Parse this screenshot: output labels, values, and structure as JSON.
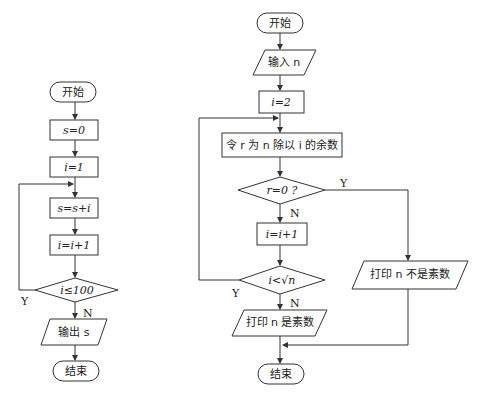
{
  "flowchart_left": {
    "start": "开始",
    "step1": "s=0",
    "step2": "i=1",
    "step3": "s=s+i",
    "step4": "i=i+1",
    "condition": "i≤100",
    "yes_label": "Y",
    "no_label": "N",
    "output": "输出 s",
    "end": "结束"
  },
  "flowchart_right": {
    "start": "开始",
    "input": "输入 n",
    "init": "i=2",
    "remainder": "令 r 为 n 除以 i 的余数",
    "cond1": "r=0 ?",
    "cond1_yes": "Y",
    "cond1_no": "N",
    "increment": "i=i+1",
    "cond2": "i<√n",
    "cond2_yes": "Y",
    "cond2_no": "N",
    "print_prime": "打印 n 是素数",
    "print_not_prime": "打印 n 不是素数",
    "end": "结束"
  }
}
